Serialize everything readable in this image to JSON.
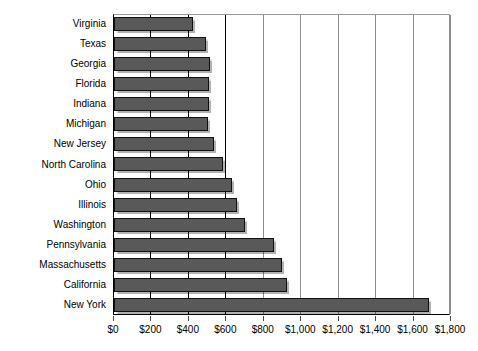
{
  "chart_data": {
    "type": "bar",
    "orientation": "horizontal",
    "title": "",
    "xlabel": "",
    "ylabel": "",
    "xlim": [
      0,
      1800
    ],
    "xtick_step": 200,
    "grid": true,
    "legend": false,
    "bar_color": "#595959",
    "bar_border_color": "#111111",
    "plot_background": "#ffffff",
    "gridline_color": "#000000",
    "xticks": [
      "$0",
      "$200",
      "$400",
      "$600",
      "$800",
      "$1,000",
      "$1,200",
      "$1,400",
      "$1,600",
      "$1,800"
    ],
    "xtick_values": [
      0,
      200,
      400,
      600,
      800,
      1000,
      1200,
      1400,
      1600,
      1800
    ],
    "categories": [
      "Virginia",
      "Texas",
      "Georgia",
      "Florida",
      "Indiana",
      "Michigan",
      "New Jersey",
      "North Carolina",
      "Ohio",
      "Illinois",
      "Washington",
      "Pennsylvania",
      "Massachusetts",
      "California",
      "New York"
    ],
    "values": [
      420,
      490,
      515,
      510,
      505,
      500,
      535,
      580,
      630,
      655,
      700,
      855,
      895,
      925,
      1680
    ]
  }
}
